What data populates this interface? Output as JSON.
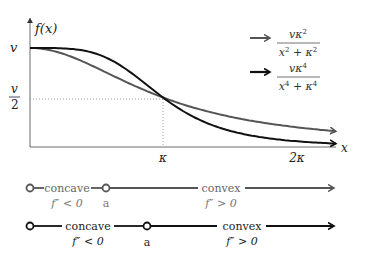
{
  "chart_data": {
    "type": "line",
    "title": "",
    "xlabel": "x",
    "ylabel": "f(x)",
    "x_ticks": [
      {
        "value": 1,
        "label": "κ"
      },
      {
        "value": 2,
        "label": "2κ"
      }
    ],
    "y_ticks": [
      {
        "value": 1,
        "label": "v"
      },
      {
        "value": 0.5,
        "label": "v/2",
        "numerator": "v",
        "denominator": "2"
      }
    ],
    "x_range": [
      0,
      2.3
    ],
    "y_range": [
      0,
      1
    ],
    "guides": [
      {
        "type": "dotted",
        "from": [
          0,
          0.5
        ],
        "to": [
          1,
          0.5
        ]
      },
      {
        "type": "dotted",
        "from": [
          1,
          0.5
        ],
        "to": [
          1,
          0
        ]
      }
    ],
    "series": [
      {
        "name": "vκ²/(x²+κ²)",
        "color": "#555555",
        "power": 2,
        "x": [
          0,
          0.25,
          0.5,
          0.75,
          1.0,
          1.25,
          1.5,
          1.75,
          2.0,
          2.3
        ],
        "values": [
          1.0,
          0.941,
          0.8,
          0.64,
          0.5,
          0.39,
          0.308,
          0.246,
          0.2,
          0.159
        ]
      },
      {
        "name": "vκ⁴/(x⁴+κ⁴)",
        "color": "#111111",
        "power": 4,
        "x": [
          0,
          0.25,
          0.5,
          0.75,
          1.0,
          1.25,
          1.5,
          1.75,
          2.0,
          2.3
        ],
        "values": [
          1.0,
          0.996,
          0.941,
          0.76,
          0.5,
          0.291,
          0.165,
          0.097,
          0.059,
          0.034
        ]
      }
    ],
    "legend": [
      {
        "numerator": "vκ²",
        "denominator": "x² + κ²",
        "color": "#555555"
      },
      {
        "numerator": "vκ⁴",
        "denominator": "x⁴ + κ⁴",
        "color": "#111111"
      }
    ]
  },
  "axis": {
    "y_label": "f(x)",
    "x_label": "x",
    "v_label": "v",
    "half_num": "v",
    "half_den": "2",
    "kappa": "κ",
    "two_kappa": "2κ"
  },
  "legend": {
    "items": [
      {
        "num": "vκ",
        "num_sup": "2",
        "den_a": "x",
        "den_a_sup": "2",
        "den_op": " + ",
        "den_b": "κ",
        "den_b_sup": "2"
      },
      {
        "num": "vκ",
        "num_sup": "4",
        "den_a": "x",
        "den_a_sup": "4",
        "den_op": " + ",
        "den_b": "κ",
        "den_b_sup": "4"
      }
    ]
  },
  "convexity": {
    "rows": [
      {
        "color": "#555555",
        "concave": "concave",
        "concave_cond": "f″ < 0",
        "point": "a",
        "convex": "convex",
        "convex_cond": "f″ > 0"
      },
      {
        "color": "#111111",
        "concave": "concave",
        "concave_cond": "f″ < 0",
        "point": "a",
        "convex": "convex",
        "convex_cond": "f″ > 0"
      }
    ]
  }
}
